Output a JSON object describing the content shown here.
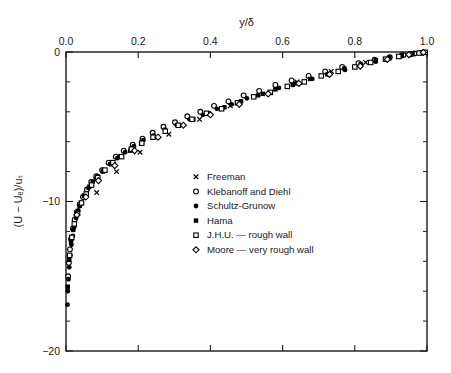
{
  "chart_data": {
    "type": "scatter",
    "title": "",
    "xlabel": "y/δ",
    "ylabel": "(U − Uₑ)/uₜ",
    "xlabel_position": "top",
    "xlim": [
      0.0,
      1.0
    ],
    "ylim": [
      -20,
      0
    ],
    "x_ticks": [
      0.0,
      0.2,
      0.4,
      0.6,
      0.8,
      1.0
    ],
    "x_tick_labels": [
      "0.0",
      "0.2",
      "0.4",
      "0.6",
      "0.8",
      "1.0"
    ],
    "y_ticks": [
      0,
      -10,
      -20
    ],
    "y_tick_labels": [
      "0",
      "−10",
      "−20"
    ],
    "y_minor_ticks": [
      -2,
      -4,
      -6,
      -8,
      -12,
      -14,
      -16,
      -18
    ],
    "grid": false,
    "frame": "box",
    "bottom_axis_labels": false,
    "legend_position": "center",
    "series": [
      {
        "name": "Freeman",
        "marker": "x",
        "fill": "none",
        "points": [
          [
            0.085,
            -9.4
          ],
          [
            0.14,
            -8.0
          ],
          [
            0.205,
            -6.7
          ],
          [
            0.285,
            -5.5
          ],
          [
            0.37,
            -4.5
          ],
          [
            0.455,
            -3.6
          ],
          [
            0.545,
            -2.8
          ],
          [
            0.64,
            -2.0
          ],
          [
            0.735,
            -1.3
          ],
          [
            0.83,
            -0.7
          ],
          [
            0.92,
            -0.3
          ],
          [
            0.985,
            -0.05
          ]
        ]
      },
      {
        "name": "Klebanoff and Diehl",
        "marker": "circle-open",
        "fill": "none",
        "points": [
          [
            0.006,
            -15.0
          ],
          [
            0.008,
            -14.1
          ],
          [
            0.011,
            -13.2
          ],
          [
            0.014,
            -12.5
          ],
          [
            0.019,
            -11.8
          ],
          [
            0.024,
            -11.2
          ],
          [
            0.03,
            -10.7
          ],
          [
            0.038,
            -10.2
          ],
          [
            0.047,
            -9.7
          ],
          [
            0.058,
            -9.2
          ],
          [
            0.07,
            -8.7
          ],
          [
            0.084,
            -8.3
          ],
          [
            0.1,
            -7.9
          ],
          [
            0.118,
            -7.4
          ],
          [
            0.138,
            -7.0
          ],
          [
            0.16,
            -6.6
          ],
          [
            0.185,
            -6.2
          ],
          [
            0.212,
            -5.8
          ],
          [
            0.24,
            -5.4
          ],
          [
            0.27,
            -5.0
          ],
          [
            0.302,
            -4.7
          ],
          [
            0.336,
            -4.3
          ],
          [
            0.372,
            -4.0
          ],
          [
            0.41,
            -3.6
          ],
          [
            0.45,
            -3.3
          ],
          [
            0.492,
            -2.9
          ],
          [
            0.535,
            -2.6
          ],
          [
            0.58,
            -2.2
          ],
          [
            0.625,
            -1.9
          ],
          [
            0.672,
            -1.6
          ],
          [
            0.718,
            -1.3
          ],
          [
            0.765,
            -1.0
          ],
          [
            0.81,
            -0.75
          ],
          [
            0.855,
            -0.52
          ],
          [
            0.897,
            -0.34
          ],
          [
            0.935,
            -0.2
          ],
          [
            0.965,
            -0.1
          ],
          [
            0.988,
            -0.04
          ]
        ]
      },
      {
        "name": "Schultz-Grunow",
        "marker": "circle-filled",
        "fill": "solid",
        "points": [
          [
            0.004,
            -16.9
          ],
          [
            0.005,
            -16.0
          ],
          [
            0.007,
            -15.2
          ],
          [
            0.009,
            -14.4
          ],
          [
            0.012,
            -13.6
          ],
          [
            0.015,
            -12.9
          ],
          [
            0.019,
            -12.3
          ],
          [
            0.023,
            -11.7
          ],
          [
            0.028,
            -11.1
          ],
          [
            0.034,
            -10.6
          ],
          [
            0.042,
            -10.1
          ],
          [
            0.051,
            -9.6
          ],
          [
            0.062,
            -9.1
          ],
          [
            0.074,
            -8.7
          ],
          [
            0.088,
            -8.3
          ],
          [
            0.104,
            -7.9
          ],
          [
            0.122,
            -7.5
          ],
          [
            0.142,
            -7.1
          ],
          [
            0.164,
            -6.7
          ],
          [
            0.188,
            -6.3
          ],
          [
            0.214,
            -5.9
          ],
          [
            0.243,
            -5.6
          ],
          [
            0.274,
            -5.2
          ],
          [
            0.307,
            -4.9
          ],
          [
            0.342,
            -4.5
          ],
          [
            0.379,
            -4.2
          ],
          [
            0.418,
            -3.8
          ],
          [
            0.459,
            -3.5
          ],
          [
            0.501,
            -3.1
          ],
          [
            0.545,
            -2.8
          ],
          [
            0.59,
            -2.4
          ],
          [
            0.636,
            -2.1
          ],
          [
            0.682,
            -1.8
          ],
          [
            0.728,
            -1.5
          ],
          [
            0.773,
            -1.2
          ],
          [
            0.817,
            -0.9
          ],
          [
            0.858,
            -0.65
          ],
          [
            0.896,
            -0.45
          ],
          [
            0.93,
            -0.28
          ],
          [
            0.958,
            -0.16
          ],
          [
            0.98,
            -0.07
          ],
          [
            0.995,
            -0.02
          ]
        ]
      },
      {
        "name": "Hama",
        "marker": "square-filled",
        "fill": "solid",
        "points": [
          [
            0.005,
            -15.7
          ],
          [
            0.009,
            -13.9
          ],
          [
            0.014,
            -12.7
          ],
          [
            0.02,
            -11.9
          ],
          [
            0.028,
            -11.0
          ],
          [
            0.038,
            -10.3
          ],
          [
            0.05,
            -9.6
          ],
          [
            0.065,
            -9.0
          ],
          [
            0.082,
            -8.5
          ],
          [
            0.102,
            -8.0
          ],
          [
            0.125,
            -7.5
          ],
          [
            0.15,
            -7.0
          ],
          [
            0.178,
            -6.6
          ],
          [
            0.208,
            -6.1
          ],
          [
            0.241,
            -5.7
          ],
          [
            0.276,
            -5.3
          ],
          [
            0.313,
            -4.9
          ],
          [
            0.353,
            -4.5
          ],
          [
            0.395,
            -4.1
          ],
          [
            0.439,
            -3.7
          ],
          [
            0.485,
            -3.3
          ],
          [
            0.532,
            -2.9
          ],
          [
            0.58,
            -2.5
          ],
          [
            0.628,
            -2.2
          ],
          [
            0.676,
            -1.8
          ],
          [
            0.724,
            -1.5
          ],
          [
            0.771,
            -1.1
          ],
          [
            0.816,
            -0.8
          ],
          [
            0.858,
            -0.55
          ],
          [
            0.896,
            -0.35
          ],
          [
            0.93,
            -0.2
          ],
          [
            0.96,
            -0.1
          ],
          [
            0.984,
            -0.03
          ]
        ]
      },
      {
        "name": "J.H.U. — rough wall",
        "marker": "square-open",
        "fill": "none",
        "points": [
          [
            0.01,
            -13.6
          ],
          [
            0.016,
            -12.4
          ],
          [
            0.023,
            -11.5
          ],
          [
            0.032,
            -10.8
          ],
          [
            0.043,
            -10.1
          ],
          [
            0.056,
            -9.5
          ],
          [
            0.071,
            -8.9
          ],
          [
            0.088,
            -8.4
          ],
          [
            0.108,
            -7.9
          ],
          [
            0.13,
            -7.4
          ],
          [
            0.154,
            -7.0
          ],
          [
            0.181,
            -6.5
          ],
          [
            0.21,
            -6.1
          ],
          [
            0.241,
            -5.7
          ],
          [
            0.275,
            -5.3
          ],
          [
            0.311,
            -4.9
          ],
          [
            0.349,
            -4.5
          ],
          [
            0.389,
            -4.1
          ],
          [
            0.431,
            -3.8
          ],
          [
            0.475,
            -3.4
          ],
          [
            0.52,
            -3.0
          ],
          [
            0.566,
            -2.7
          ],
          [
            0.613,
            -2.3
          ],
          [
            0.66,
            -2.0
          ],
          [
            0.707,
            -1.6
          ],
          [
            0.754,
            -1.3
          ],
          [
            0.8,
            -1.0
          ],
          [
            0.844,
            -0.7
          ],
          [
            0.885,
            -0.48
          ],
          [
            0.922,
            -0.3
          ],
          [
            0.953,
            -0.16
          ],
          [
            0.978,
            -0.07
          ],
          [
            0.995,
            -0.02
          ]
        ]
      },
      {
        "name": "Moore — very rough wall",
        "marker": "diamond-open",
        "fill": "none",
        "points": [
          [
            0.03,
            -10.9
          ],
          [
            0.055,
            -9.7
          ],
          [
            0.09,
            -8.6
          ],
          [
            0.135,
            -7.6
          ],
          [
            0.19,
            -6.6
          ],
          [
            0.255,
            -5.7
          ],
          [
            0.325,
            -4.9
          ],
          [
            0.4,
            -4.2
          ],
          [
            0.48,
            -3.5
          ],
          [
            0.56,
            -2.8
          ],
          [
            0.645,
            -2.1
          ],
          [
            0.73,
            -1.5
          ],
          [
            0.815,
            -0.95
          ],
          [
            0.89,
            -0.5
          ],
          [
            0.95,
            -0.18
          ],
          [
            0.99,
            -0.03
          ]
        ]
      }
    ]
  },
  "axes": {
    "x_axis_title": "y/δ",
    "y_axis_title": "(U − Uₑ)/uₜ",
    "x_tick_labels": [
      "0.0",
      "0.2",
      "0.4",
      "0.6",
      "0.8",
      "1.0"
    ],
    "y_tick_labels": [
      "0",
      "−10",
      "−20"
    ]
  },
  "legend": {
    "items": [
      {
        "marker": "x",
        "label": "Freeman"
      },
      {
        "marker": "circle-open",
        "label": "Klebanoff and Diehl"
      },
      {
        "marker": "circle-filled",
        "label": "Schultz-Grunow"
      },
      {
        "marker": "square-filled",
        "label": "Hama"
      },
      {
        "marker": "square-open",
        "label": "J.H.U. — rough wall"
      },
      {
        "marker": "diamond-open",
        "label": "Moore — very rough wall"
      }
    ]
  },
  "colors": {
    "axis": "#1a1a1a",
    "marker": "#000000",
    "background": "#ffffff"
  }
}
